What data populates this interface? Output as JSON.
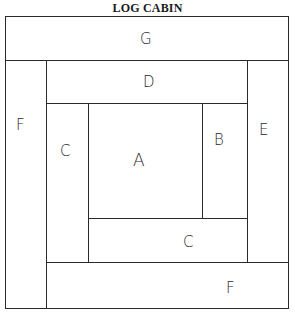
{
  "title": "LOG CABIN",
  "pieces": {
    "G": "G",
    "D": "D",
    "F_left": "F",
    "C_left": "C",
    "A": "A",
    "B": "B",
    "E": "E",
    "C_bottom": "C",
    "F_bottom": "F"
  }
}
